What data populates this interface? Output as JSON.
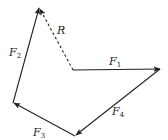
{
  "diagram": {
    "type": "vector-polygon",
    "stroke_color": "#222222",
    "background": "#ffffff",
    "vectors": [
      {
        "name": "F1",
        "label_main": "F",
        "label_sub": "1",
        "from": [
          73,
          70
        ],
        "to": [
          160,
          69
        ],
        "style": "solid"
      },
      {
        "name": "F4",
        "label_main": "F",
        "label_sub": "4",
        "from": [
          160,
          69
        ],
        "to": [
          75,
          136
        ],
        "style": "solid"
      },
      {
        "name": "F3",
        "label_main": "F",
        "label_sub": "3",
        "from": [
          75,
          136
        ],
        "to": [
          13,
          103
        ],
        "style": "solid"
      },
      {
        "name": "F2",
        "label_main": "F",
        "label_sub": "2",
        "from": [
          13,
          103
        ],
        "to": [
          39,
          7
        ],
        "style": "solid"
      },
      {
        "name": "R",
        "label_main": "R",
        "label_sub": "",
        "from": [
          73,
          70
        ],
        "to": [
          39,
          7
        ],
        "style": "dashed"
      }
    ]
  }
}
